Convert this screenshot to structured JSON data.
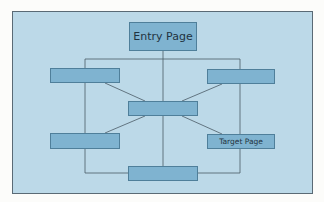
{
  "diagram": {
    "type": "site-navigation-structure",
    "colors": {
      "background": "#bcd9e8",
      "node_fill": "#7fb3d0",
      "node_border": "#4f7f9a",
      "line": "#4a5a66",
      "frame_border": "#5a6a75"
    },
    "nodes": [
      {
        "id": "entry",
        "label": "Entry Page"
      },
      {
        "id": "left-top",
        "label": ""
      },
      {
        "id": "right-top",
        "label": ""
      },
      {
        "id": "center",
        "label": ""
      },
      {
        "id": "left-bottom",
        "label": ""
      },
      {
        "id": "target",
        "label": "Target Page"
      },
      {
        "id": "bottom",
        "label": ""
      }
    ],
    "edges": [
      [
        "entry",
        "center"
      ],
      [
        "entry",
        "left-top"
      ],
      [
        "entry",
        "right-top"
      ],
      [
        "left-top",
        "center"
      ],
      [
        "right-top",
        "center"
      ],
      [
        "center",
        "left-bottom"
      ],
      [
        "center",
        "target"
      ],
      [
        "center",
        "bottom"
      ],
      [
        "left-top",
        "left-bottom"
      ],
      [
        "right-top",
        "target"
      ],
      [
        "left-bottom",
        "bottom"
      ],
      [
        "target",
        "bottom"
      ]
    ]
  }
}
